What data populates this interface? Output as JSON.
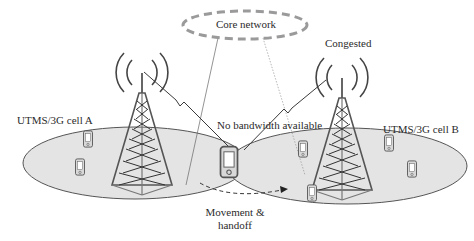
{
  "diagram": {
    "core_network": {
      "label": "Core network"
    },
    "cells": [
      {
        "id": "A",
        "label": "UTMS/3G cell A"
      },
      {
        "id": "B",
        "label": "UTMS/3G cell B"
      }
    ],
    "annotations": {
      "congested": "Congested",
      "no_bandwidth": "No bandwidth available",
      "movement_line1": "Movement &",
      "movement_line2": "handoff"
    },
    "colors": {
      "cell_fill": "#e4e4e4",
      "cell_stroke": "#555555",
      "core_dash": "#9a9a9a",
      "tower": "#4a4a4a",
      "link": "#3a3a3a"
    }
  }
}
